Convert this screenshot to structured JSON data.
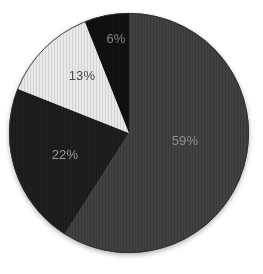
{
  "chart_data": {
    "type": "pie",
    "title": "",
    "slices": [
      {
        "label": "59%",
        "value": 59,
        "color": "#3e3e3e",
        "label_color": "#8f8f8f"
      },
      {
        "label": "22%",
        "value": 22,
        "color": "#1b1b1b",
        "label_color": "#999999"
      },
      {
        "label": "13%",
        "value": 13,
        "color": "#e9e9e9",
        "label_color": "#484848"
      },
      {
        "label": "6%",
        "value": 6,
        "color": "#0e0e0e",
        "label_color": "#848484"
      }
    ],
    "start_angle_deg": 0,
    "direction": "clockwise",
    "legend_position": "none",
    "background": "#ffffff",
    "outline_color": "#2e2e2e",
    "label_positions": [
      {
        "x": 185,
        "y": 140
      },
      {
        "x": 65,
        "y": 154
      },
      {
        "x": 82,
        "y": 75
      },
      {
        "x": 116,
        "y": 38
      }
    ]
  }
}
